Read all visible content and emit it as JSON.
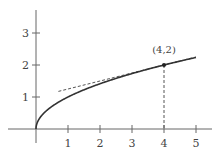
{
  "chart_data": {
    "type": "line",
    "title": "",
    "xlabel": "",
    "ylabel": "",
    "xlim": [
      0,
      5.5
    ],
    "ylim": [
      0,
      3.6
    ],
    "grid": false,
    "x_ticks": [
      "1",
      "2",
      "3",
      "4",
      "5"
    ],
    "y_ticks": [
      "1",
      "2",
      "3"
    ],
    "series": [
      {
        "name": "y = sqrt(x)",
        "style": "solid",
        "function": "sqrt(x)",
        "x_range": [
          0,
          5
        ]
      },
      {
        "name": "tangent line at (4,2)",
        "style": "dashed",
        "function": "1 + x/4",
        "x_range": [
          0.7,
          5
        ]
      }
    ],
    "annotations": [
      {
        "text": "(4,2)",
        "x": 4,
        "y": 2,
        "marker": "dot",
        "drop_line": "dashed vertical to x-axis"
      }
    ]
  },
  "labels": {
    "x_ticks": [
      "1",
      "2",
      "3",
      "4",
      "5"
    ],
    "y_ticks": [
      "1",
      "2",
      "3"
    ],
    "point": "(4,2)"
  },
  "colors": {
    "axis": "#666666",
    "curve": "#333333",
    "dashed": "#555555"
  }
}
